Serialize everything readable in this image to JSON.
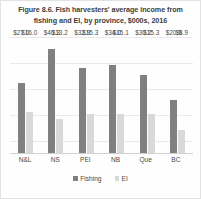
{
  "chart_data": {
    "type": "bar",
    "title": "Figure 8.6. Fish harvesters' average income from fishing and EI, by province, $000s, 2016",
    "title_line1": "Figure 8.6. Fish harvesters' average income from",
    "title_line2": "fishing and EI, by province, $000s, 2016",
    "categories": [
      "N&L",
      "NS",
      "PEI",
      "NB",
      "Que",
      "BC"
    ],
    "series": [
      {
        "name": "Fishing",
        "color": "#808080",
        "values": [
          27.0,
          40.3,
          32.9,
          34.0,
          30.2,
          20.6
        ],
        "labels": [
          "$27.0",
          "$40.3",
          "$32.9",
          "$34.0",
          "$30.2",
          "$20.6"
        ]
      },
      {
        "name": "EI",
        "color": "#d9d9d9",
        "values": [
          16.0,
          13.2,
          15.3,
          15.1,
          15.3,
          8.9
        ],
        "labels": [
          "$16.0",
          "$13.2",
          "$15.3",
          "$15.1",
          "$15.3",
          "$8.9"
        ]
      }
    ],
    "xlabel": "",
    "ylabel": "",
    "ylim": [
      0,
      45
    ],
    "grid": true,
    "y_tick_labels_visible": false,
    "legend_position": "bottom",
    "legend": [
      "Fishing",
      "EI"
    ]
  }
}
